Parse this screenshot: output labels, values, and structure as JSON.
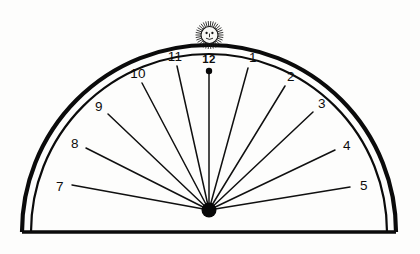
{
  "figure": {
    "background_color": "#fdfdfc",
    "ink_color": "#0b0b0b"
  },
  "plate": {
    "outer_arc_name": "outer-border-arc",
    "inner_arc_name": "inner-border-arc",
    "base_edge_name": "base-edge-line",
    "center": {
      "x": 209,
      "y": 210
    },
    "outer_radius": 187,
    "inner_radius": 178,
    "base_y": 232
  },
  "gnomon": {
    "nodus_label": "center-nodus-dot",
    "nodus_radius": 7.5,
    "noon_tip_radius": 3.2
  },
  "sun_emblem": {
    "name": "sun-face-emblem",
    "center": {
      "x": 209.5,
      "y": 35
    },
    "disc_radius": 8.5,
    "ray_count": 34,
    "ray_length": 5.5
  },
  "chart_data": {
    "type": "scatter",
    "xlabel": "",
    "ylabel": "",
    "categories": [
      "7",
      "8",
      "9",
      "10",
      "11",
      "12",
      "1",
      "2",
      "3",
      "4",
      "5"
    ],
    "values": [
      0,
      1,
      2,
      3,
      4,
      5,
      6,
      7,
      8,
      9,
      10
    ],
    "hour_lines": [
      {
        "hour_label": "7",
        "label_x": 60,
        "label_y": 187,
        "line_start_x": 72,
        "line_start_y": 185,
        "angle_deg": 170.5,
        "line_length": 140
      },
      {
        "hour_label": "8",
        "label_x": 75,
        "label_y": 144,
        "line_start_x": 86,
        "line_start_y": 148,
        "angle_deg": 159.0,
        "line_length": 134
      },
      {
        "hour_label": "9",
        "label_x": 99,
        "label_y": 107,
        "line_start_x": 108,
        "line_start_y": 114,
        "angle_deg": 147.5,
        "line_length": 122
      },
      {
        "hour_label": "10",
        "label_x": 138,
        "label_y": 74,
        "line_start_x": 142,
        "line_start_y": 83,
        "angle_deg": 133.0,
        "line_length": 132
      },
      {
        "hour_label": "11",
        "label_x": 175,
        "label_y": 57,
        "line_start_x": 177,
        "line_start_y": 66,
        "angle_deg": 114.0,
        "line_length": 152
      },
      {
        "hour_label": "12",
        "label_x": 209,
        "label_y": 60,
        "line_start_x": 209,
        "line_start_y": 71,
        "angle_deg": 90.0,
        "line_length": 137
      },
      {
        "hour_label": "1",
        "label_x": 253,
        "label_y": 58,
        "line_start_x": 248,
        "line_start_y": 68,
        "angle_deg": 69.0,
        "line_length": 150
      },
      {
        "hour_label": "2",
        "label_x": 291,
        "label_y": 77,
        "line_start_x": 285,
        "line_start_y": 86,
        "angle_deg": 51.5,
        "line_length": 136
      },
      {
        "hour_label": "3",
        "label_x": 322,
        "label_y": 104,
        "line_start_x": 313,
        "line_start_y": 112,
        "angle_deg": 38.0,
        "line_length": 126
      },
      {
        "hour_label": "4",
        "label_x": 347,
        "label_y": 146,
        "line_start_x": 335,
        "line_start_y": 150,
        "angle_deg": 22.5,
        "line_length": 132
      },
      {
        "hour_label": "5",
        "label_x": 364,
        "label_y": 186,
        "line_start_x": 350,
        "line_start_y": 187,
        "angle_deg": 9.5,
        "line_length": 143
      }
    ]
  }
}
